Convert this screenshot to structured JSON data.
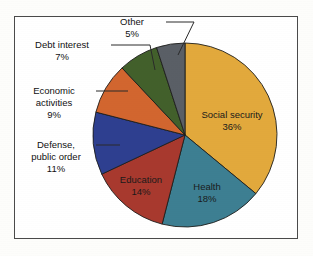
{
  "chart_data": {
    "type": "pie",
    "title": "",
    "subtitle": "",
    "xlabel": "",
    "ylabel": "",
    "legend_position": "none",
    "grid": false,
    "categories": [
      "Social security",
      "Health",
      "Education",
      "Defense, public order",
      "Economic activities",
      "Debt interest",
      "Other"
    ],
    "values": [
      36,
      18,
      14,
      11,
      9,
      7,
      5
    ],
    "value_unit": "%",
    "start_angle_deg": 0,
    "direction": "clockwise",
    "slices": [
      {
        "label": "Social security",
        "label_line1": "Social security",
        "value": 36,
        "value_text": "36%",
        "color": "#e2a93c",
        "label_placement": "inside",
        "label_x": 232,
        "label_y": 118,
        "value_x": 232,
        "value_y": 130
      },
      {
        "label": "Health",
        "label_line1": "Health",
        "value": 18,
        "value_text": "18%",
        "color": "#3d7f92",
        "label_placement": "inside",
        "label_x": 207,
        "label_y": 190,
        "value_x": 207,
        "value_y": 202
      },
      {
        "label": "Education",
        "label_line1": "Education",
        "value": 14,
        "value_text": "14%",
        "color": "#a8392e",
        "label_placement": "inside",
        "label_x": 141,
        "label_y": 183,
        "value_x": 141,
        "value_y": 195
      },
      {
        "label": "Defense, public order",
        "label_line1": "Defense,",
        "label_line2": "public order",
        "value": 11,
        "value_text": "11%",
        "color": "#2e3f90",
        "label_placement": "outside",
        "label_x": 56,
        "label_y": 148,
        "leader": "M 96 145 L 120 145"
      },
      {
        "label": "Economic activities",
        "label_line1": "Economic",
        "label_line2": "activities",
        "value": 9,
        "value_text": "9%",
        "color": "#d2662f",
        "label_placement": "outside",
        "label_x": 54,
        "label_y": 94,
        "leader": "M 96 91 L 128 91"
      },
      {
        "label": "Debt interest",
        "label_line1": "Debt interest",
        "value": 7,
        "value_text": "7%",
        "color": "#42602b",
        "label_placement": "outside",
        "label_x": 62,
        "label_y": 48,
        "leader": "M 111 45 L 150 45 L 155 70"
      },
      {
        "label": "Other",
        "label_line1": "Other",
        "value": 5,
        "value_text": "5%",
        "color": "#5a5f66",
        "label_placement": "outside",
        "label_x": 132,
        "label_y": 25,
        "leader": "M 166 22 L 194 22 L 178 55"
      }
    ],
    "geometry": {
      "center_x": 185,
      "center_y": 135,
      "radius": 92
    }
  }
}
